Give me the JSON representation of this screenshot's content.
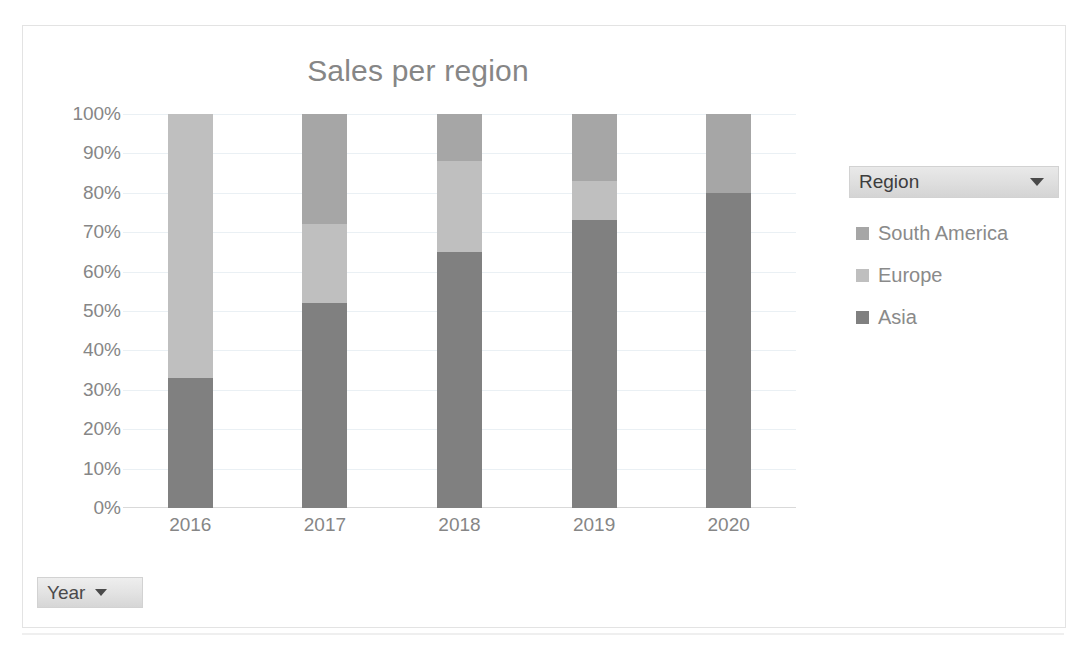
{
  "chart": {
    "title": "Sales per region",
    "year_filter": {
      "label": "Year",
      "icon": "chevron-down-icon"
    },
    "legend": {
      "header": "Region",
      "header_icon": "chevron-down-icon",
      "items": [
        {
          "label": "South America",
          "color": "#a6a6a6"
        },
        {
          "label": "Europe",
          "color": "#bfbfbf"
        },
        {
          "label": "Asia",
          "color": "#808080"
        }
      ]
    }
  },
  "chart_data": {
    "type": "bar",
    "stacked": "100%",
    "title": "Sales per region",
    "xlabel": "Year",
    "ylabel": "",
    "categories": [
      "2016",
      "2017",
      "2018",
      "2019",
      "2020"
    ],
    "yticks": [
      "0%",
      "10%",
      "20%",
      "30%",
      "40%",
      "50%",
      "60%",
      "70%",
      "80%",
      "90%",
      "100%"
    ],
    "ylim": [
      0,
      100
    ],
    "grid": true,
    "legend_position": "right",
    "legend_title": "Region",
    "series": [
      {
        "name": "Asia",
        "color": "#808080",
        "values": [
          33,
          52,
          65,
          73,
          80
        ]
      },
      {
        "name": "Europe",
        "color": "#bfbfbf",
        "values": [
          67,
          20,
          23,
          10,
          0
        ]
      },
      {
        "name": "South America",
        "color": "#a6a6a6",
        "values": [
          0,
          28,
          12,
          17,
          20
        ]
      }
    ],
    "stack_order_bottom_to_top": [
      "Asia",
      "Europe",
      "South America"
    ]
  },
  "page_bleed_text": "·          ·        ·"
}
